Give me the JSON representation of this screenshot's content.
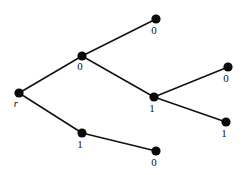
{
  "figure": {
    "background_color": "#ffffff",
    "line_color": "#111111",
    "node_color": "#0a0a0a"
  },
  "chart_data": {
    "type": "diagram",
    "subtype": "node-link-tree",
    "title": "",
    "xlabel": "",
    "ylabel": "",
    "grid": false,
    "legend": null,
    "xlim": [
      0,
      246
    ],
    "ylim": [
      0,
      175
    ],
    "nodes": [
      {
        "id": "root",
        "label": "r",
        "x": 19,
        "y": 93,
        "label_x": 16,
        "label_y": 107,
        "radius": 4.6,
        "italic": true
      },
      {
        "id": "n0",
        "label": "0",
        "x": 82,
        "y": 56,
        "label_x": 80,
        "label_y": 70,
        "radius": 4.6,
        "italic": false
      },
      {
        "id": "n00",
        "label": "0",
        "x": 156,
        "y": 19,
        "label_x": 154,
        "label_y": 34,
        "radius": 4.6,
        "italic": false
      },
      {
        "id": "n01",
        "label": "1",
        "x": 154,
        "y": 97,
        "label_x": 152,
        "label_y": 112,
        "radius": 4.6,
        "italic": false
      },
      {
        "id": "n010",
        "label": "0",
        "x": 228,
        "y": 67,
        "label_x": 226,
        "label_y": 82,
        "radius": 4.6,
        "italic": false
      },
      {
        "id": "n011",
        "label": "1",
        "x": 226,
        "y": 122,
        "label_x": 224,
        "label_y": 137,
        "radius": 4.6,
        "italic": false
      },
      {
        "id": "n1",
        "label": "1",
        "x": 82,
        "y": 133,
        "label_x": 80,
        "label_y": 148,
        "radius": 4.6,
        "italic": false
      },
      {
        "id": "n10",
        "label": "0",
        "x": 156,
        "y": 151,
        "label_x": 154,
        "label_y": 166,
        "radius": 4.6,
        "italic": false
      }
    ],
    "edges": [
      {
        "from": "root",
        "to": "n0",
        "x1": 19,
        "y1": 93,
        "x2": 82,
        "y2": 56
      },
      {
        "from": "root",
        "to": "n1",
        "x1": 19,
        "y1": 93,
        "x2": 82,
        "y2": 133
      },
      {
        "from": "n0",
        "to": "n00",
        "x1": 82,
        "y1": 56,
        "x2": 156,
        "y2": 19
      },
      {
        "from": "n0",
        "to": "n01",
        "x1": 82,
        "y1": 56,
        "x2": 154,
        "y2": 97
      },
      {
        "from": "n01",
        "to": "n010",
        "x1": 154,
        "y1": 97,
        "x2": 228,
        "y2": 67
      },
      {
        "from": "n01",
        "to": "n011",
        "x1": 154,
        "y1": 97,
        "x2": 226,
        "y2": 122
      },
      {
        "from": "n1",
        "to": "n10",
        "x1": 82,
        "y1": 133,
        "x2": 156,
        "y2": 151
      }
    ]
  }
}
